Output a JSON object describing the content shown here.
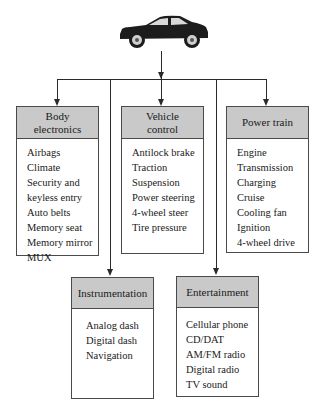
{
  "diagram": {
    "root": {
      "icon": "car-icon"
    },
    "boxes": [
      {
        "id": "body-electronics",
        "title": "Body\nelectronics",
        "items": [
          "Airbags",
          "Climate",
          "Security and keyless entry",
          "Auto belts",
          "Memory seat",
          "Memory mirror",
          "MUX"
        ]
      },
      {
        "id": "vehicle-control",
        "title": "Vehicle\ncontrol",
        "items": [
          "Antilock brake",
          "Traction",
          "Suspension",
          "Power steering",
          "4-wheel steer",
          "Tire pressure"
        ]
      },
      {
        "id": "power-train",
        "title": "Power train",
        "items": [
          "Engine",
          "Transmission",
          "Charging",
          "Cruise",
          "Cooling fan",
          "Ignition",
          "4-wheel drive"
        ]
      },
      {
        "id": "instrumentation",
        "title": "Instrumentation",
        "items": [
          "Analog dash",
          "Digital dash",
          "Navigation"
        ]
      },
      {
        "id": "entertainment",
        "title": "Entertainment",
        "items": [
          "Cellular phone",
          "CD/DAT",
          "AM/FM radio",
          "Digital radio",
          "TV sound"
        ]
      }
    ],
    "colors": {
      "header_fill": "#c9c9c9",
      "line": "#2a2a2a",
      "border": "#4a4a4a"
    }
  }
}
